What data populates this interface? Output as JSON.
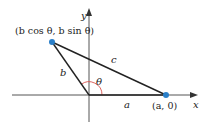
{
  "diagram": {
    "type": "triangle-in-coordinate-plane",
    "colors": {
      "axis": "#555555",
      "triangle": "#222222",
      "point": "#2a7fc8",
      "angle_arc": "#d9534f",
      "text": "#222222"
    },
    "axes": {
      "x_label": "x",
      "y_label": "y"
    },
    "points": {
      "p1_label": "(b cos θ, b sin θ)",
      "p2_label": "(a, 0)"
    },
    "sides": {
      "a": "a",
      "b": "b",
      "c": "c"
    },
    "angle": {
      "label": "θ"
    }
  }
}
